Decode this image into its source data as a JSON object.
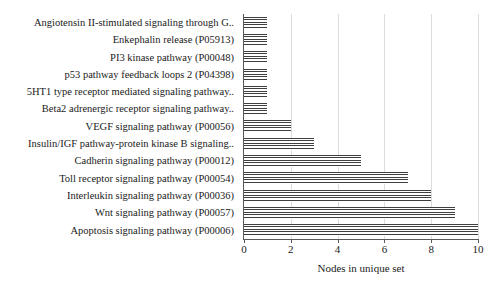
{
  "chart_data": {
    "type": "bar",
    "orientation": "horizontal",
    "title": "",
    "xlabel": "Nodes in unique set",
    "ylabel": "",
    "xlim": [
      0,
      10
    ],
    "xticks": [
      "0",
      "2",
      "4",
      "6",
      "8",
      "10"
    ],
    "xtick_values": [
      0,
      2,
      4,
      6,
      8,
      10
    ],
    "grid": "vertical",
    "legend": "none",
    "bar_fill": "horizontal-hatch",
    "categories": [
      "Angiotensin II-stimulated signaling through G..",
      "Enkephalin release (P05913)",
      "PI3 kinase pathway (P00048)",
      "p53 pathway feedback loops 2 (P04398)",
      "5HT1 type receptor mediated signaling pathway..",
      "Beta2 adrenergic receptor signaling pathway..",
      "VEGF signaling pathway (P00056)",
      "Insulin/IGF pathway-protein kinase B signaling..",
      "Cadherin signaling pathway (P00012)",
      "Toll receptor signaling pathway (P00054)",
      "Interleukin signaling pathway (P00036)",
      "Wnt signaling pathway (P00057)",
      "Apoptosis signaling pathway (P00006)"
    ],
    "values": [
      1,
      1,
      1,
      1,
      1,
      1,
      2,
      3,
      5,
      7,
      8,
      9,
      10
    ]
  },
  "colors": {
    "background": "#ffffff",
    "bar_stroke": "#3f3f3f",
    "axis": "#5a5a5a",
    "gridline": "#dcdcdc",
    "text": "#1a1a1a"
  }
}
